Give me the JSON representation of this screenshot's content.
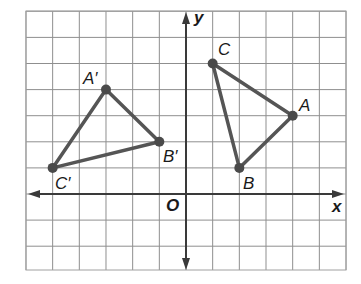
{
  "diagram": {
    "type": "coordinate-plane-transformation",
    "grid": {
      "x_min": -6,
      "x_max": 6,
      "y_min": -3,
      "y_max": 7,
      "origin_px": [
        186,
        194
      ],
      "unit_px_x": 26.67,
      "unit_px_y": 26.1,
      "line_color": "#8a8a8a",
      "border_color": "#9a9a9a"
    },
    "axes": {
      "x_label": "x",
      "y_label": "y",
      "origin_label": "O",
      "color": "#3a3a3a"
    },
    "triangles": [
      {
        "name": "ABC",
        "color": "#555555",
        "vertices": [
          {
            "label": "A",
            "x": 4,
            "y": 3
          },
          {
            "label": "B",
            "x": 2,
            "y": 1
          },
          {
            "label": "C",
            "x": 1,
            "y": 5
          }
        ]
      },
      {
        "name": "A'B'C'",
        "color": "#555555",
        "vertices": [
          {
            "label": "A′",
            "x": -3,
            "y": 4
          },
          {
            "label": "B′",
            "x": -1,
            "y": 2
          },
          {
            "label": "C′",
            "x": -5,
            "y": 1
          }
        ]
      }
    ]
  },
  "labels": {
    "A": "A",
    "B": "B",
    "C": "C",
    "A_prime": "A′",
    "B_prime": "B′",
    "C_prime": "C′",
    "x_axis": "x",
    "y_axis": "y",
    "origin": "O"
  }
}
